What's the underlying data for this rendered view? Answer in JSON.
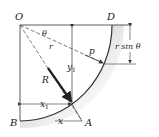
{
  "figure": {
    "points": {
      "O": "O",
      "D": "D",
      "B": "B",
      "A": "A"
    },
    "labels": {
      "theta": "θ",
      "r": "r",
      "p": "p",
      "R": "R",
      "y1": "y",
      "y1_sub": "1",
      "x1": "x",
      "x1_sub": "1",
      "x": "x",
      "r_sin_theta": "r sin θ"
    },
    "colors": {
      "line": "#333333",
      "surface_shadow": "#9a9a9a",
      "background": "#ffffff"
    }
  }
}
